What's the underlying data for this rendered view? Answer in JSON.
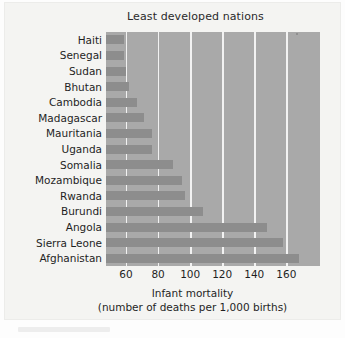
{
  "chart_data": {
    "type": "bar",
    "orientation": "horizontal",
    "title": "Least developed nations",
    "xlabel_line1": "Infant mortality",
    "xlabel_line2": "(number of deaths per 1,000 births)",
    "ylabel": "",
    "categories": [
      "Haiti",
      "Senegal",
      "Sudan",
      "Bhutan",
      "Cambodia",
      "Madagascar",
      "Mauritania",
      "Uganda",
      "Somalia",
      "Mozambique",
      "Rwanda",
      "Burundi",
      "Angola",
      "Sierra Leone",
      "Afghanistan"
    ],
    "values": [
      59,
      59,
      60,
      62,
      67,
      71,
      76,
      76,
      89,
      95,
      97,
      108,
      148,
      158,
      168
    ],
    "xticks": [
      60,
      80,
      100,
      120,
      140,
      160
    ],
    "xticklabels": [
      "60",
      "80",
      "100",
      "120",
      "140",
      "160"
    ],
    "xlim": [
      47.5,
      181
    ],
    "grid": true,
    "legend": false,
    "colors": {
      "plot_background": "#a9a9a9",
      "bar": "#8d8d8d",
      "gridline": "#f2f2f2",
      "panel_background": "#f4f4f2",
      "text": "#1f1f1f"
    }
  }
}
